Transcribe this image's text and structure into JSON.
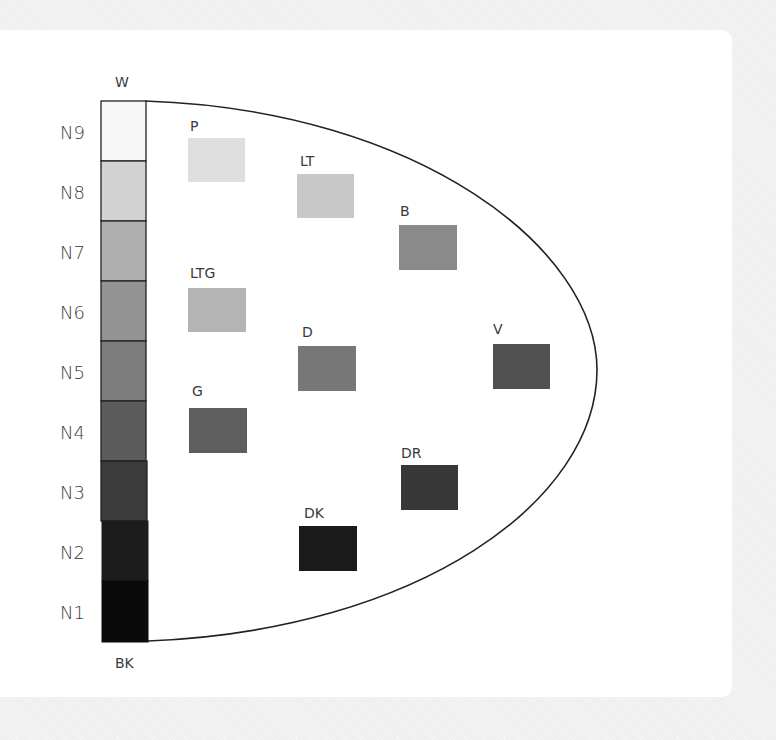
{
  "diagram": {
    "scale": {
      "top_label": "W",
      "bottom_label": "BK",
      "steps": [
        {
          "label": "N9",
          "color": "#f7f7f7"
        },
        {
          "label": "N8",
          "color": "#d3d3d3"
        },
        {
          "label": "N7",
          "color": "#b0b0b0"
        },
        {
          "label": "N6",
          "color": "#939393"
        },
        {
          "label": "N5",
          "color": "#7c7c7c"
        },
        {
          "label": "N4",
          "color": "#5c5c5c"
        },
        {
          "label": "N3",
          "color": "#3b3b3b"
        },
        {
          "label": "N2",
          "color": "#1c1c1c"
        },
        {
          "label": "N1",
          "color": "#0a0a0a"
        }
      ]
    },
    "tones": [
      {
        "label": "P",
        "color": "#dedede"
      },
      {
        "label": "LT",
        "color": "#c8c8c8"
      },
      {
        "label": "B",
        "color": "#8a8a8a"
      },
      {
        "label": "LTG",
        "color": "#b4b4b4"
      },
      {
        "label": "D",
        "color": "#777777"
      },
      {
        "label": "V",
        "color": "#505050"
      },
      {
        "label": "G",
        "color": "#5e5e5e"
      },
      {
        "label": "DR",
        "color": "#373737"
      },
      {
        "label": "DK",
        "color": "#1a1a1a"
      }
    ]
  }
}
